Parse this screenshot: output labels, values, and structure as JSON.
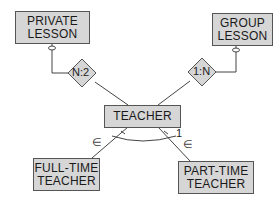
{
  "diagram": {
    "entities": {
      "private_lesson": {
        "line1": "PRIVATE",
        "line2": "LESSON"
      },
      "group_lesson": {
        "line1": "GROUP",
        "line2": "LESSON"
      },
      "teacher": {
        "line1": "TEACHER"
      },
      "full_time_teacher": {
        "line1": "FULL-TIME",
        "line2": "TEACHER"
      },
      "part_time_teacher": {
        "line1": "PART-TIME",
        "line2": "TEACHER"
      }
    },
    "relationships": {
      "private_rel": {
        "label": "N:2"
      },
      "group_rel": {
        "label": "1:N"
      }
    },
    "subtype_marks": {
      "left": "∈",
      "right": "∈",
      "cardinality": "1"
    },
    "colors": {
      "entity_fill": "#d6d6d6",
      "line": "#444444"
    }
  }
}
